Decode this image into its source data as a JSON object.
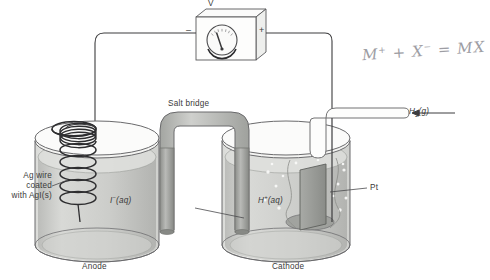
{
  "diagram": {
    "type": "electrochemical-cell-schematic"
  },
  "meter": {
    "symbol": "V",
    "negative_terminal": "–",
    "positive_terminal": "+"
  },
  "labels": {
    "salt_bridge": "Salt bridge",
    "ag_wire_line1": "Ag wire",
    "ag_wire_line2": "coated",
    "ag_wire_line3": "with AgI(s)",
    "left_solution": "I–(aq)",
    "right_solution": "H+(aq)",
    "platinum": "Pt",
    "hydrogen_gas": "H2(g)",
    "anode": "Anode",
    "cathode": "Cathode"
  },
  "annotation": {
    "handwritten_equation": "M+ + X– = MX"
  },
  "colors": {
    "outline": "#58585a",
    "solution": "#c8c9c6",
    "glass": "#e8e9e7",
    "salt_bridge": "#b6b8b4",
    "salt_bridge_leg": "#9a9c99",
    "electrode": "#8f918e",
    "text": "#3a3a3a",
    "pencil": "#8d8d93"
  }
}
